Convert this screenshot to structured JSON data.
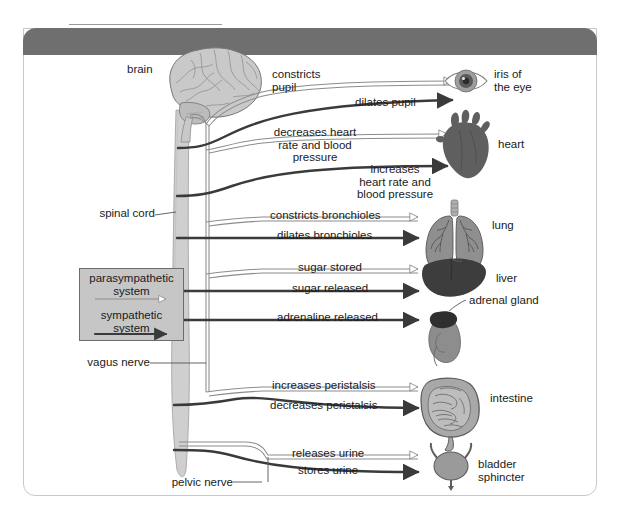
{
  "figure": {
    "title": "Figure 3.30: The autonomic nervous system"
  },
  "anatomy_labels": {
    "brain": "brain",
    "spinal_cord": "spinal cord",
    "vagus_nerve": "vagus nerve",
    "pelvic_nerve": "pelvic nerve"
  },
  "legend": {
    "parasympathetic_line1": "parasympathetic",
    "parasympathetic_line2": "system",
    "sympathetic_line1": "sympathetic",
    "sympathetic_line2": "system"
  },
  "organs": [
    {
      "id": "eye",
      "label_line1": "iris of",
      "label_line2": "the eye"
    },
    {
      "id": "heart",
      "label_line1": "heart",
      "label_line2": ""
    },
    {
      "id": "lung",
      "label_line1": "lung",
      "label_line2": ""
    },
    {
      "id": "liver",
      "label_line1": "liver",
      "label_line2": ""
    },
    {
      "id": "adrenal",
      "label_line1": "adrenal gland",
      "label_line2": ""
    },
    {
      "id": "intestine",
      "label_line1": "intestine",
      "label_line2": ""
    },
    {
      "id": "bladder",
      "label_line1": "bladder",
      "label_line2": "sphincter"
    }
  ],
  "effects": {
    "eye_para_l1": "constricts",
    "eye_para_l2": "pupil",
    "eye_symp": "dilates pupil",
    "heart_para_l1": "decreases heart",
    "heart_para_l2": "rate and blood",
    "heart_para_l3": "pressure",
    "heart_symp_l1": "increases",
    "heart_symp_l2": "heart rate and",
    "heart_symp_l3": "blood pressure",
    "lung_para": "constricts bronchioles",
    "lung_symp": "dilates bronchioles",
    "liver_para": "sugar stored",
    "liver_symp": "sugar released",
    "adrenal_symp": "adrenaline released",
    "intestine_para": "increases peristalsis",
    "intestine_symp": "decreases peristalsis",
    "bladder_para": "releases urine",
    "bladder_symp": "stores urine"
  },
  "colors": {
    "title_bar": "#6f6f6f",
    "frame_border": "#c8c8c8",
    "legend_bg": "#c6c6c6",
    "cord_fill": "#cfcfcf",
    "sympathetic_line": "#3a3a3a",
    "parasympathetic_line": "#8c8c8c",
    "organ_dark": "#4a4a4a",
    "organ_mid": "#8a8a8a",
    "organ_light": "#b4b4b4",
    "text": "#1a1a1a"
  }
}
